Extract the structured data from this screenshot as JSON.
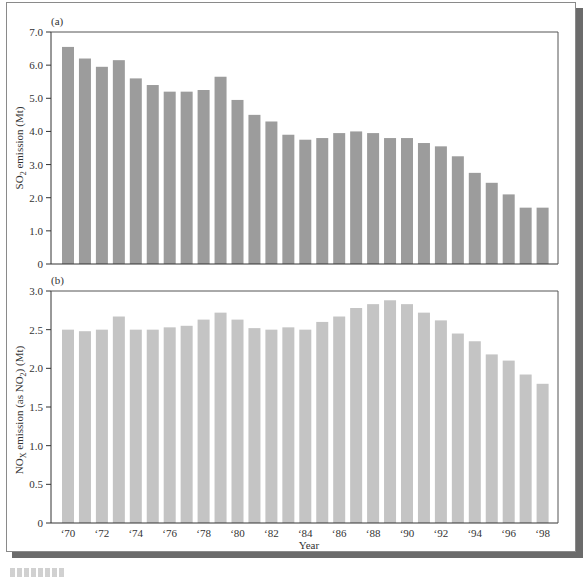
{
  "figure": {
    "caption_stub": "FIGURE"
  },
  "chart_data": [
    {
      "type": "bar",
      "panel_label": "(a)",
      "title": "",
      "xlabel": "",
      "ylabel": "SO2 emission (Mt)",
      "ylabel_main": "SO",
      "ylabel_sub": "2",
      "ylabel_rest": " emission (Mt)",
      "ylim": [
        0,
        7.0
      ],
      "yticks": [
        0,
        1.0,
        2.0,
        3.0,
        4.0,
        5.0,
        6.0,
        7.0
      ],
      "ytick_labels": [
        "0",
        "1.0",
        "2.0",
        "3.0",
        "4.0",
        "5.0",
        "6.0",
        "7.0"
      ],
      "grid": false,
      "bar_color": "#9c9c9c",
      "categories": [
        "1970",
        "1971",
        "1972",
        "1973",
        "1974",
        "1975",
        "1976",
        "1977",
        "1978",
        "1979",
        "1980",
        "1981",
        "1982",
        "1983",
        "1984",
        "1985",
        "1986",
        "1987",
        "1988",
        "1989",
        "1990",
        "1991",
        "1992",
        "1993",
        "1994",
        "1995",
        "1996",
        "1997",
        "1998"
      ],
      "values": [
        6.55,
        6.2,
        5.95,
        6.15,
        5.6,
        5.4,
        5.2,
        5.2,
        5.25,
        5.65,
        4.95,
        4.5,
        4.3,
        3.9,
        3.75,
        3.8,
        3.95,
        4.0,
        3.95,
        3.8,
        3.8,
        3.65,
        3.55,
        3.25,
        2.75,
        2.45,
        2.1,
        1.7,
        1.7
      ]
    },
    {
      "type": "bar",
      "panel_label": "(b)",
      "title": "",
      "xlabel": "Year",
      "ylabel": "NOX emission (as NO2) (Mt)",
      "ylabel_parts": [
        "NO",
        "X",
        " emission (as NO",
        "2",
        ") (Mt)"
      ],
      "ylim": [
        0,
        3.0
      ],
      "yticks": [
        0,
        0.5,
        1.0,
        1.5,
        2.0,
        2.5,
        3.0
      ],
      "ytick_labels": [
        "0",
        "0.5",
        "1.0",
        "1.5",
        "2.0",
        "2.5",
        "3.0"
      ],
      "grid": false,
      "bar_color": "#c4c4c4",
      "categories": [
        "1970",
        "1971",
        "1972",
        "1973",
        "1974",
        "1975",
        "1976",
        "1977",
        "1978",
        "1979",
        "1980",
        "1981",
        "1982",
        "1983",
        "1984",
        "1985",
        "1986",
        "1987",
        "1988",
        "1989",
        "1990",
        "1991",
        "1992",
        "1993",
        "1994",
        "1995",
        "1996",
        "1997",
        "1998"
      ],
      "xtick_labels": [
        "‘70",
        "‘72",
        "‘74",
        "‘76",
        "‘78",
        "‘80",
        "‘82",
        "‘84",
        "‘86",
        "‘88",
        "‘90",
        "‘92",
        "‘94",
        "‘96",
        "‘98"
      ],
      "values": [
        2.5,
        2.48,
        2.5,
        2.67,
        2.5,
        2.5,
        2.53,
        2.55,
        2.63,
        2.72,
        2.63,
        2.52,
        2.5,
        2.53,
        2.5,
        2.6,
        2.67,
        2.78,
        2.83,
        2.88,
        2.83,
        2.72,
        2.62,
        2.45,
        2.35,
        2.18,
        2.1,
        1.92,
        1.8
      ]
    }
  ]
}
